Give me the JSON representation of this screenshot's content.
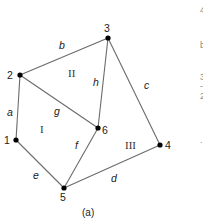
{
  "figure": {
    "caption": "(a)",
    "colors": {
      "edge": "#6b6b6b",
      "vertex": "#000000",
      "text": "#1a1a1a"
    },
    "vertices": [
      {
        "id": "1",
        "label": "1"
      },
      {
        "id": "2",
        "label": "2"
      },
      {
        "id": "3",
        "label": "3"
      },
      {
        "id": "4",
        "label": "4"
      },
      {
        "id": "5",
        "label": "5"
      },
      {
        "id": "6",
        "label": "6"
      }
    ],
    "edges": [
      {
        "id": "a",
        "label": "a",
        "from": "1",
        "to": "2"
      },
      {
        "id": "b",
        "label": "b",
        "from": "2",
        "to": "3"
      },
      {
        "id": "c",
        "label": "c",
        "from": "3",
        "to": "4"
      },
      {
        "id": "d",
        "label": "d",
        "from": "5",
        "to": "4"
      },
      {
        "id": "e",
        "label": "e",
        "from": "1",
        "to": "5"
      },
      {
        "id": "f",
        "label": "f",
        "from": "5",
        "to": "6"
      },
      {
        "id": "g",
        "label": "g",
        "from": "2",
        "to": "6"
      },
      {
        "id": "h",
        "label": "h",
        "from": "6",
        "to": "3"
      }
    ],
    "faces": [
      {
        "id": "I",
        "label": "I"
      },
      {
        "id": "II",
        "label": "II"
      },
      {
        "id": "III",
        "label": "III"
      }
    ],
    "clipped_margin_text": [
      "4",
      "b",
      "3",
      "-",
      "2",
      "."
    ]
  }
}
